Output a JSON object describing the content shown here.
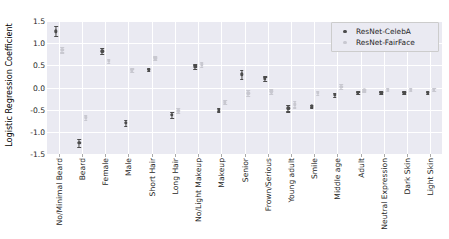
{
  "chart_data": {
    "type": "scatter",
    "title": "",
    "xlabel": "",
    "ylabel": "Logistic Regression Coefficient",
    "ylim": [
      -1.5,
      1.5
    ],
    "yticks": [
      "1.5",
      "1.0",
      "0.5",
      "0.0",
      "-0.5",
      "-1.0",
      "-1.5"
    ],
    "ytick_values": [
      1.5,
      1.0,
      0.5,
      0.0,
      -0.5,
      -1.0,
      -1.5
    ],
    "grid": true,
    "legend_position": "upper right",
    "categories": [
      "No/Minimal Beard",
      "Beard",
      "Female",
      "Male",
      "Short Hair",
      "Long Hair",
      "No/Light Makeup",
      "Makeup",
      "Senior",
      "Frown/Serious",
      "Young adult",
      "Smile",
      "Middle age",
      "Adult",
      "Neutral Expression",
      "Dark Skin",
      "Light Skin"
    ],
    "series": [
      {
        "name": "ResNet-CelebA",
        "color": "#4c4c4c",
        "values": [
          1.27,
          -1.25,
          0.82,
          -0.8,
          0.4,
          -0.62,
          0.47,
          -0.5,
          0.3,
          0.2,
          -0.47,
          -0.42,
          -0.17,
          -0.12,
          -0.12,
          -0.12,
          -0.12
        ],
        "errors": [
          0.11,
          0.09,
          0.07,
          0.07,
          0.03,
          0.06,
          0.05,
          0.04,
          0.1,
          0.05,
          0.07,
          0.03,
          0.05,
          0.03,
          0.03,
          0.03,
          0.03
        ]
      },
      {
        "name": "ResNet-FairFace",
        "color": "#c8c8d0",
        "values": [
          0.85,
          -0.67,
          0.6,
          0.39,
          0.66,
          -0.52,
          0.52,
          -0.33,
          -0.13,
          -0.09,
          -0.38,
          -0.12,
          0.02,
          -0.06,
          -0.05,
          -0.05,
          -0.05
        ],
        "errors": [
          0.06,
          0.06,
          0.05,
          0.04,
          0.04,
          0.05,
          0.06,
          0.04,
          0.07,
          0.05,
          0.07,
          0.04,
          0.05,
          0.03,
          0.03,
          0.03,
          0.03
        ]
      }
    ],
    "legend": [
      {
        "label": "ResNet-CelebA",
        "color": "#4c4c4c"
      },
      {
        "label": "ResNet-FairFace",
        "color": "#c8c8d0"
      }
    ]
  }
}
